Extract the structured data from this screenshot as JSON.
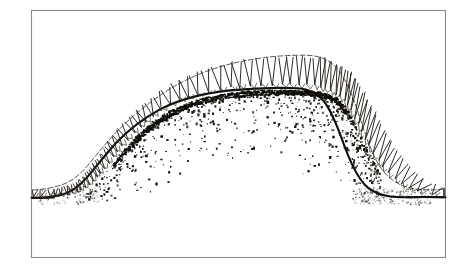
{
  "figure": {
    "kind": "line-drawing",
    "title": "Hand-drawn cross-section illustration",
    "background_color": "#ffffff",
    "ink_color": "#100e0c",
    "hatch_color": "#242019",
    "outer_contour_color": "#3b3832",
    "frame_color": "#8a8a8f",
    "stipple_color": "#18150f"
  },
  "frame": {
    "label": "illustration-border",
    "x": 31,
    "y": 10,
    "width": 415,
    "height": 248,
    "stroke_width": 1.1
  },
  "chart_data": {
    "type": "line",
    "xlabel": "",
    "ylabel": "",
    "xlim": [
      31,
      446
    ],
    "ylim": [
      258,
      10
    ],
    "grid": false,
    "legend": null,
    "series": [
      {
        "name": "inner-contour",
        "style": "solid-heavy",
        "x": [
          33,
          52,
          66,
          78,
          88,
          97,
          106,
          116,
          128,
          142,
          158,
          178,
          200,
          224,
          248,
          272,
          294,
          312,
          326,
          337,
          346,
          354,
          362,
          371,
          382,
          396,
          414,
          444
        ],
        "y": [
          198,
          197.5,
          196,
          193,
          188,
          180,
          170,
          157,
          143,
          129,
          116,
          105,
          97,
          92,
          89,
          88,
          88,
          89,
          92,
          98,
          108,
          122,
          138,
          154,
          170,
          183,
          192,
          197
        ]
      },
      {
        "name": "outer-contour",
        "style": "dashed-light",
        "x": [
          33,
          50,
          62,
          72,
          80,
          88,
          96,
          105,
          116,
          130,
          147,
          167,
          190,
          214,
          240,
          266,
          290,
          310,
          326,
          339,
          350,
          360,
          370,
          380,
          392,
          406,
          422,
          444
        ],
        "y": [
          190,
          189,
          187,
          184,
          178,
          169,
          158,
          145,
          130,
          115,
          100,
          86,
          74,
          65,
          59,
          56,
          55,
          55,
          57,
          62,
          70,
          84,
          100,
          118,
          140,
          160,
          176,
          188
        ]
      },
      {
        "name": "baseline-left",
        "style": "solid-heavy",
        "x": [
          31,
          56
        ],
        "y": [
          198,
          198
        ]
      },
      {
        "name": "baseline-right",
        "style": "solid-heavy",
        "x": [
          412,
          446
        ],
        "y": [
          196,
          197
        ]
      }
    ],
    "annotations": [
      {
        "name": "hatch-band",
        "type": "hatching",
        "note": "Repeated zigzag / V / hook tick marks drawn between the inner and outer contours, roughly perpendicular to the profile; about 62 marks following the full arc."
      },
      {
        "name": "crest-crust",
        "type": "dense-stipple-line",
        "note": "Very dark broken stipple line hugging the underside of the inner contour across the plateau top from x=120 to x=345."
      },
      {
        "name": "interior-stipple",
        "type": "stipple",
        "note": "Ink dots scattered below the inner contour, fading downward; density highest near the crest and along the right slope around x=300-370, y=90-200."
      }
    ]
  }
}
